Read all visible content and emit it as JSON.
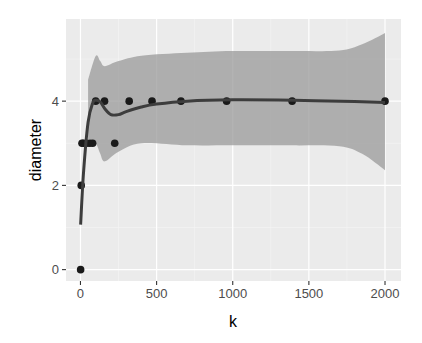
{
  "chart_data": {
    "type": "scatter",
    "title": "",
    "xlabel": "k",
    "ylabel": "diameter",
    "xlim": [
      -95,
      2105
    ],
    "ylim": [
      -0.27,
      5.95
    ],
    "xticks": [
      0,
      500,
      1000,
      1500,
      2000
    ],
    "xtick_labels": [
      "0",
      "500",
      "1000",
      "1500",
      "2000"
    ],
    "yticks": [
      0,
      2,
      4
    ],
    "ytick_labels": [
      "0",
      "2",
      "4"
    ],
    "grid": true,
    "legend": null,
    "points": {
      "x": [
        1,
        5,
        10,
        20,
        40,
        60,
        80,
        100,
        158,
        225,
        320,
        470,
        660,
        960,
        1390,
        2000
      ],
      "y": [
        0,
        2,
        3,
        3,
        3,
        3,
        3,
        4,
        4,
        3,
        4,
        4,
        4,
        4,
        4,
        4
      ]
    },
    "smooth_line": {
      "method": "loess",
      "x": [
        1,
        20,
        50,
        80,
        100,
        130,
        160,
        200,
        250,
        300,
        400,
        500,
        700,
        1000,
        1400,
        1800,
        2000
      ],
      "y": [
        1.07,
        2.3,
        3.5,
        3.95,
        4.02,
        3.98,
        3.82,
        3.68,
        3.68,
        3.75,
        3.86,
        3.93,
        4.0,
        4.03,
        4.02,
        3.99,
        3.97
      ]
    },
    "confidence_band": {
      "x": [
        50,
        100,
        130,
        160,
        250,
        400,
        700,
        1000,
        1400,
        1700,
        1850,
        2000
      ],
      "upper": [
        4.5,
        5.07,
        4.95,
        4.83,
        4.95,
        5.08,
        5.15,
        5.19,
        5.19,
        5.2,
        5.35,
        5.62
      ],
      "lower": [
        3.1,
        3.0,
        2.75,
        2.57,
        2.8,
        3.0,
        2.95,
        2.95,
        2.95,
        2.93,
        2.75,
        2.36
      ]
    },
    "colors": {
      "panel_background": "#ebebeb",
      "grid_major": "#ffffff",
      "grid_minor": "#f5f5f5",
      "points": "#1a1a1a",
      "line": "#3d3d3d",
      "band": "#999999"
    }
  }
}
